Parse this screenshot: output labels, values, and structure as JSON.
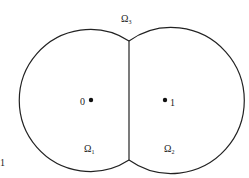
{
  "diagram": {
    "regions": {
      "top": {
        "symbol": "Ω",
        "sub": "3"
      },
      "left": {
        "symbol": "Ω",
        "sub": "1"
      },
      "right": {
        "symbol": "Ω",
        "sub": "2"
      }
    },
    "points": {
      "left": {
        "label": "0"
      },
      "right": {
        "label": "1"
      }
    },
    "corner_label": "1",
    "colors": {
      "stroke": "#222222",
      "background": "#ffffff"
    }
  }
}
